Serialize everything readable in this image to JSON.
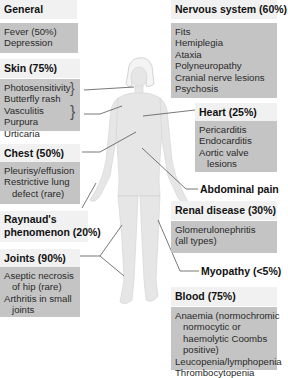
{
  "colors": {
    "header_bg": "#f1f1f1",
    "content_bg": "#c4c4c4",
    "figure": "#e4e4e4",
    "leader_lines": "#555555"
  },
  "left": {
    "general": {
      "title": "General",
      "items": [
        "Fever (50%)",
        "Depression"
      ]
    },
    "skin": {
      "title": "Skin (75%)",
      "items": [
        "Photosensitivity",
        "Butterfly rash",
        "Vasculitis",
        "Purpura",
        "Urticaria"
      ]
    },
    "chest": {
      "title": "Chest (50%)",
      "items": [
        "Pleurisy/effusion",
        "Restrictive lung",
        "defect (rare)"
      ]
    },
    "raynauds": {
      "line1": "Raynaud's",
      "line2": "phenomenon (20%)"
    },
    "joints": {
      "title": "Joints (90%)",
      "items": [
        "Aseptic necrosis",
        "of hip (rare)",
        "Arthritis in small",
        "joints"
      ]
    }
  },
  "right": {
    "nervous": {
      "title": "Nervous system (60%)",
      "items": [
        "Fits",
        "Hemiplegia",
        "Ataxia",
        "Polyneuropathy",
        "Cranial nerve lesions",
        "Psychosis"
      ]
    },
    "heart": {
      "title": "Heart (25%)",
      "items": [
        "Pericarditis",
        "Endocarditis",
        "Aortic valve",
        "lesions"
      ]
    },
    "abdominal": {
      "title": "Abdominal pain"
    },
    "renal": {
      "title": "Renal disease (30%)",
      "items": [
        "Glomerulonephritis",
        "(all types)"
      ]
    },
    "myopathy": {
      "title": "Myopathy (<5%)"
    },
    "blood": {
      "title": "Blood (75%)",
      "items": [
        "Anaemia (normochromic",
        "normocytic or",
        "haemolytic Coombs",
        "positive)",
        "Leucopenia/lymphopenia",
        "Thrombocytopenia"
      ]
    }
  }
}
